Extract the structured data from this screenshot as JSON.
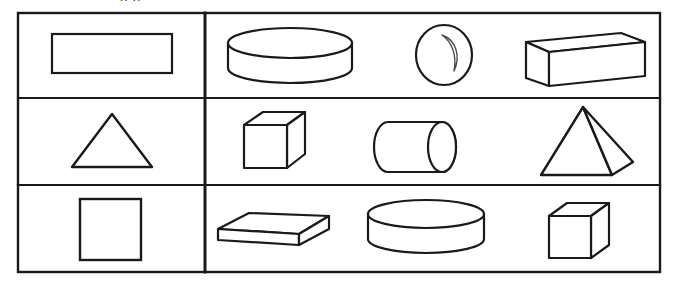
{
  "page": {
    "background_color": "#ffffff",
    "line_color": "#1a1a1a",
    "clipped_header_text": "p p"
  },
  "table": {
    "outer_border": {
      "x": 18,
      "y": 13,
      "width": 642,
      "height": 259,
      "stroke_width": 2.4
    },
    "column_divider_x": 205,
    "row_divider_y": [
      98,
      185
    ],
    "columns": [
      {
        "name": "two-dimensional-shapes",
        "x_start": 18,
        "x_end": 205
      },
      {
        "name": "three-dimensional-shapes",
        "x_start": 205,
        "x_end": 660
      }
    ],
    "rows": [
      {
        "index": 1,
        "left_cell": {
          "shape": "rectangle",
          "dimension": "2D",
          "label": "rectangle"
        },
        "right_cells": [
          {
            "shape": "cylinder-disk",
            "dimension": "3D",
            "label": "cylinder"
          },
          {
            "shape": "sphere",
            "dimension": "3D",
            "label": "sphere"
          },
          {
            "shape": "rectangular-prism",
            "dimension": "3D",
            "label": "rectangular prism"
          }
        ]
      },
      {
        "index": 2,
        "left_cell": {
          "shape": "triangle",
          "dimension": "2D",
          "label": "triangle"
        },
        "right_cells": [
          {
            "shape": "cube",
            "dimension": "3D",
            "label": "cube"
          },
          {
            "shape": "cylinder-horizontal",
            "dimension": "3D",
            "label": "cylinder"
          },
          {
            "shape": "square-pyramid",
            "dimension": "3D",
            "label": "pyramid"
          }
        ]
      },
      {
        "index": 3,
        "left_cell": {
          "shape": "square",
          "dimension": "2D",
          "label": "square"
        },
        "right_cells": [
          {
            "shape": "flat-slab-prism",
            "dimension": "3D",
            "label": "rectangular prism"
          },
          {
            "shape": "cylinder-disk",
            "dimension": "3D",
            "label": "cylinder"
          },
          {
            "shape": "cube",
            "dimension": "3D",
            "label": "cube"
          }
        ]
      }
    ]
  }
}
